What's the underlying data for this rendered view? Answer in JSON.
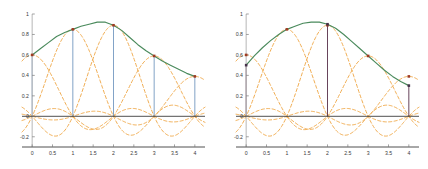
{
  "figure": {
    "title": "",
    "panel_count": 2
  },
  "style": {
    "sum_curve_color": "#4a8a5c",
    "basis_curve_color": "#efa94a",
    "sample_marker_color": "#9e3b24",
    "stem_color_left": "#7b9ec4",
    "stem_color_right": "#5f3a52",
    "secondary_marker_color": "#45324a",
    "axis_color": "#3c3c3c",
    "spine_color": "#bdbdbd",
    "tick_label_color": "#3a3a3a",
    "background": "#ffffff"
  },
  "chart_data": [
    {
      "type": "line",
      "title": "",
      "xlabel": "",
      "ylabel": "",
      "xlim": [
        -0.25,
        4.25
      ],
      "ylim": [
        -0.3,
        1.0
      ],
      "grid": false,
      "legend": "none",
      "xticks": [
        0,
        0.5,
        1,
        1.5,
        2,
        2.5,
        3,
        3.5,
        4
      ],
      "xticklabels": [
        "0",
        "0.5",
        "1",
        "1.5",
        "2",
        "2.5",
        "3",
        "3.5",
        "4"
      ],
      "yticks": [
        -0.2,
        0,
        0.2,
        0.4,
        0.6,
        0.8,
        1
      ],
      "yticklabels": [
        "-0.2",
        "0",
        "0.2",
        "0.4",
        "0.6",
        "0.8",
        "1"
      ],
      "samples": {
        "x": [
          0,
          1,
          2,
          3,
          4
        ],
        "y": [
          0.6,
          0.85,
          0.89,
          0.59,
          0.39
        ],
        "marker": "square",
        "stems": true,
        "stem_x": [
          0,
          1,
          2,
          3,
          4
        ]
      },
      "series": [
        {
          "name": "interpolated-sum",
          "style": "solid",
          "color": "#4a8a5c",
          "x": [
            0,
            0.2,
            0.4,
            0.6,
            0.8,
            1,
            1.2,
            1.4,
            1.6,
            1.8,
            2,
            2.2,
            2.4,
            2.6,
            2.8,
            3,
            3.2,
            3.4,
            3.6,
            3.8,
            4
          ],
          "y": [
            0.6,
            0.66,
            0.72,
            0.78,
            0.82,
            0.85,
            0.88,
            0.9,
            0.92,
            0.92,
            0.89,
            0.84,
            0.77,
            0.7,
            0.64,
            0.59,
            0.54,
            0.5,
            0.46,
            0.42,
            0.39
          ]
        }
      ],
      "basis_functions": {
        "style": "dashed",
        "color": "#efa94a",
        "count": 5,
        "description": "scaled sinc kernels centered at each sample x",
        "centers": [
          0,
          1,
          2,
          3,
          4
        ],
        "amplitudes": [
          0.6,
          0.85,
          0.89,
          0.59,
          0.39
        ]
      }
    },
    {
      "type": "line",
      "title": "",
      "xlabel": "",
      "ylabel": "",
      "xlim": [
        -0.25,
        4.25
      ],
      "ylim": [
        -0.3,
        1.0
      ],
      "grid": false,
      "legend": "none",
      "xticks": [
        0,
        0.5,
        1,
        1.5,
        2,
        2.5,
        3,
        3.5,
        4
      ],
      "xticklabels": [
        "0",
        "0.5",
        "1",
        "1.5",
        "2",
        "2.5",
        "3",
        "3.5",
        "4"
      ],
      "yticks": [
        -0.2,
        0,
        0.2,
        0.4,
        0.6,
        0.8,
        1
      ],
      "yticklabels": [
        "-0.2",
        "0",
        "0.2",
        "0.4",
        "0.6",
        "0.8",
        "1"
      ],
      "samples": {
        "x": [
          0,
          1,
          2,
          3,
          4
        ],
        "y": [
          0.6,
          0.85,
          0.89,
          0.59,
          0.39
        ],
        "marker": "square",
        "stems": false
      },
      "resampled": {
        "x": [
          0,
          2,
          4
        ],
        "y": [
          0.5,
          0.9,
          0.3
        ],
        "marker": "square",
        "stems": true,
        "stem_x": [
          0,
          2,
          4
        ],
        "color": "#45324a"
      },
      "series": [
        {
          "name": "reconstructed-sum",
          "style": "solid",
          "color": "#4a8a5c",
          "x": [
            0,
            0.2,
            0.4,
            0.6,
            0.8,
            1,
            1.2,
            1.4,
            1.6,
            1.8,
            2,
            2.2,
            2.4,
            2.6,
            2.8,
            3,
            3.2,
            3.4,
            3.6,
            3.8,
            4
          ],
          "y": [
            0.5,
            0.59,
            0.67,
            0.74,
            0.8,
            0.85,
            0.88,
            0.91,
            0.92,
            0.92,
            0.9,
            0.86,
            0.8,
            0.73,
            0.66,
            0.59,
            0.52,
            0.45,
            0.39,
            0.34,
            0.3
          ]
        }
      ],
      "basis_functions": {
        "style": "dashed",
        "color": "#efa94a",
        "count": 5,
        "description": "scaled sinc kernels centered at each sample x",
        "centers": [
          0,
          1,
          2,
          3,
          4
        ],
        "amplitudes": [
          0.6,
          0.85,
          0.89,
          0.59,
          0.39
        ]
      }
    }
  ]
}
